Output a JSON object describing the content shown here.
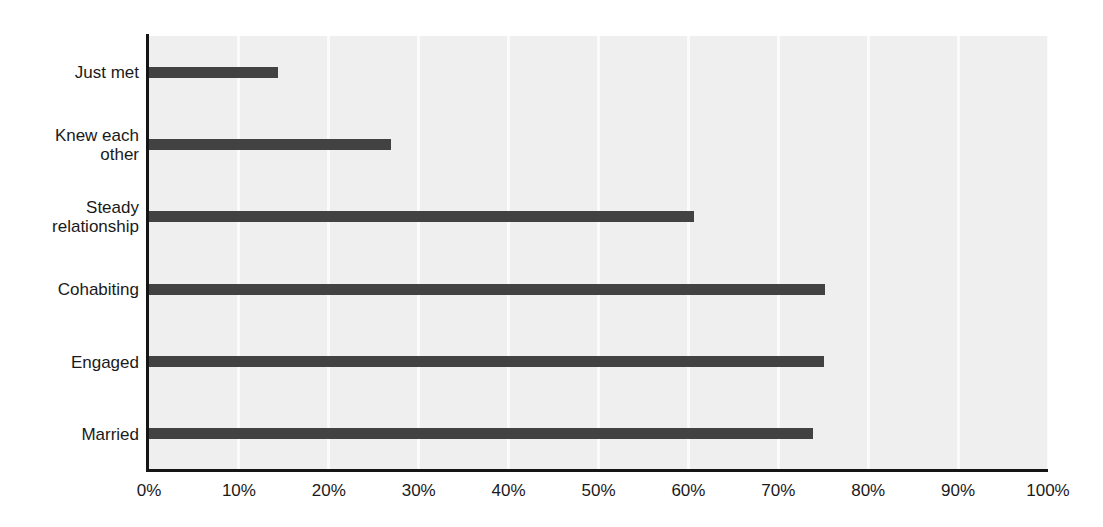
{
  "chart_data": {
    "type": "bar",
    "orientation": "horizontal",
    "title": "",
    "subtitle": "",
    "xlabel": "",
    "ylabel": "",
    "categories": [
      "Just met",
      "Knew each\nother",
      "Steady\nrelationship",
      "Cohabiting",
      "Engaged",
      "Married"
    ],
    "values": [
      14.3,
      26.9,
      60.6,
      75.2,
      75.1,
      73.9
    ],
    "series": [
      {
        "name": "",
        "values": [
          14.3,
          26.9,
          60.6,
          75.2,
          75.1,
          73.9
        ]
      }
    ],
    "xlim": [
      0,
      100
    ],
    "xticks": [
      0,
      10,
      20,
      30,
      40,
      50,
      60,
      70,
      80,
      90,
      100
    ],
    "xticklabels": [
      "0%",
      "10%",
      "20%",
      "30%",
      "40%",
      "50%",
      "60%",
      "70%",
      "80%",
      "90%",
      "100%"
    ],
    "grid": "vertical",
    "legend": "none",
    "annotations": [],
    "colors": {
      "bar": "#424242",
      "plot_background": "#efefef",
      "gridline": "#fbfbfb",
      "axis": "#151515",
      "text": "#1a1a1a",
      "page_background": "#ffffff"
    }
  }
}
